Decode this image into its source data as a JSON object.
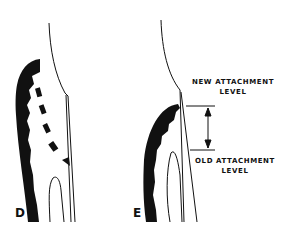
{
  "panels": [
    {
      "id": "D",
      "label": "D"
    },
    {
      "id": "E",
      "label": "E"
    }
  ],
  "annotations": {
    "new_line1": "NEW ATTACHMENT",
    "new_line2": "LEVEL",
    "old_line1": "OLD ATTACHMENT",
    "old_line2": "LEVEL"
  },
  "colors": {
    "ink": "#111111",
    "background": "#ffffff"
  }
}
